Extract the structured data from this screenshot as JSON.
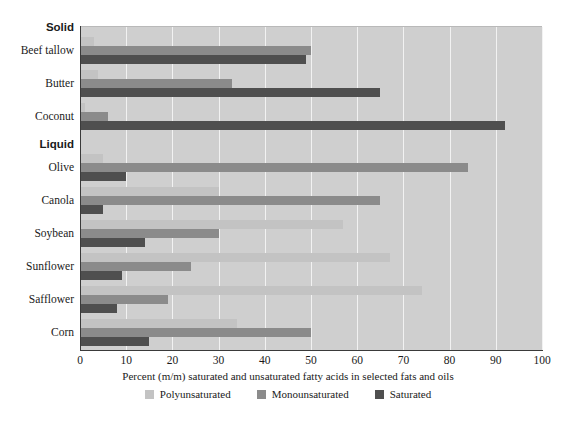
{
  "chart_data": {
    "type": "bar",
    "orientation": "horizontal",
    "title": "",
    "xlabel": "Percent (m/m) saturated and unsaturated fatty acids in selected fats and oils",
    "ylabel": "",
    "xlim": [
      0,
      100
    ],
    "xticks": [
      0,
      10,
      20,
      30,
      40,
      50,
      60,
      70,
      80,
      90,
      100
    ],
    "grid": true,
    "legend_position": "bottom",
    "groups": [
      {
        "name": "Solid",
        "categories": [
          "Beef tallow",
          "Butter",
          "Coconut"
        ]
      },
      {
        "name": "Liquid",
        "categories": [
          "Olive",
          "Canola",
          "Soybean",
          "Sunflower",
          "Safflower",
          "Corn"
        ]
      }
    ],
    "categories": [
      "Beef tallow",
      "Butter",
      "Coconut",
      "Olive",
      "Canola",
      "Soybean",
      "Sunflower",
      "Safflower",
      "Corn"
    ],
    "series": [
      {
        "name": "Polyunsaturated",
        "color": "#c3c3c3",
        "values": [
          3,
          4,
          1,
          5,
          30,
          57,
          67,
          74,
          34
        ]
      },
      {
        "name": "Monounsaturated",
        "color": "#8b8b8b",
        "values": [
          50,
          33,
          6,
          84,
          65,
          30,
          24,
          19,
          50
        ]
      },
      {
        "name": "Saturated",
        "color": "#4f4f4f",
        "values": [
          49,
          65,
          92,
          10,
          5,
          14,
          9,
          8,
          15
        ]
      }
    ]
  },
  "legend": {
    "items": [
      {
        "label": "Polyunsaturated",
        "color": "#c3c3c3"
      },
      {
        "label": "Monounsaturated",
        "color": "#8b8b8b"
      },
      {
        "label": "Saturated",
        "color": "#4f4f4f"
      }
    ]
  },
  "axis": {
    "x_title": "Percent (m/m) saturated and unsaturated fatty acids in selected fats and oils",
    "tick_labels": [
      "0",
      "10",
      "20",
      "30",
      "40",
      "50",
      "60",
      "70",
      "80",
      "90",
      "100"
    ]
  },
  "labels": {
    "group_solid": "Solid",
    "group_liquid": "Liquid",
    "beef_tallow": "Beef tallow",
    "butter": "Butter",
    "coconut": "Coconut",
    "olive": "Olive",
    "canola": "Canola",
    "soybean": "Soybean",
    "sunflower": "Sunflower",
    "safflower": "Safflower",
    "corn": "Corn"
  }
}
